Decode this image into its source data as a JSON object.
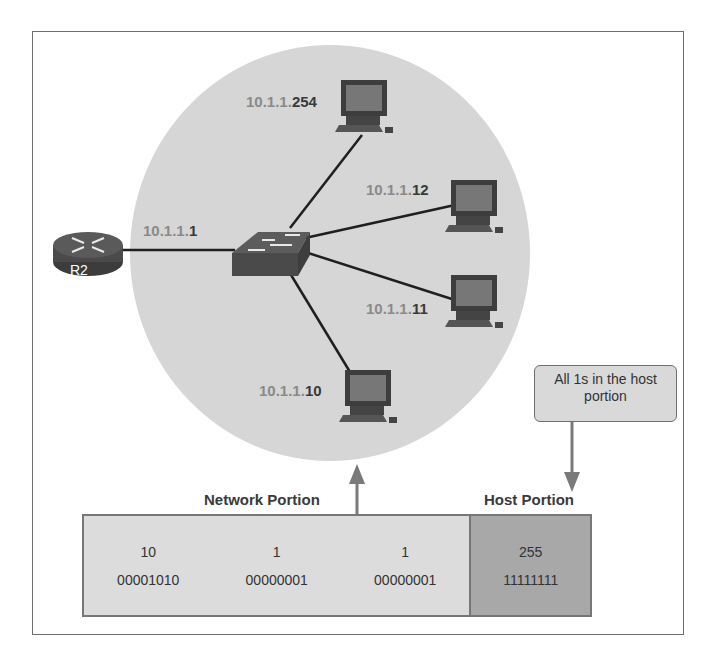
{
  "router": {
    "label": "R2",
    "ip_network": "10.1.1.",
    "ip_host": "1"
  },
  "hosts": [
    {
      "ip_network": "10.1.1.",
      "ip_host": "254"
    },
    {
      "ip_network": "10.1.1.",
      "ip_host": "12"
    },
    {
      "ip_network": "10.1.1.",
      "ip_host": "11"
    },
    {
      "ip_network": "10.1.1.",
      "ip_host": "10"
    }
  ],
  "callout": {
    "text": "All 1s in the host portion"
  },
  "labels": {
    "network_portion": "Network Portion",
    "host_portion": "Host Portion"
  },
  "address": {
    "octets": [
      {
        "decimal": "10",
        "binary": "00001010",
        "portion": "network"
      },
      {
        "decimal": "1",
        "binary": "00000001",
        "portion": "network"
      },
      {
        "decimal": "1",
        "binary": "00000001",
        "portion": "network"
      },
      {
        "decimal": "255",
        "binary": "11111111",
        "portion": "host"
      }
    ]
  },
  "colors": {
    "lan_circle": "#d6d6d6",
    "network_fill": "#dcdcdc",
    "host_fill": "#a8a8a8",
    "device": "#555555"
  }
}
